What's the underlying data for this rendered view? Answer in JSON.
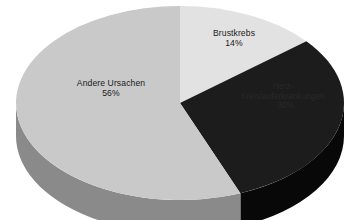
{
  "chart_data": {
    "type": "pie",
    "title": "",
    "subtitle": "",
    "xlabel": "",
    "ylabel": "",
    "legend_position": "none",
    "grid": false,
    "three_d": true,
    "start_angle_deg": 0,
    "direction": "clockwise",
    "categories": [
      "Brustkrebs",
      "Herz-Kreislauferkrankungen",
      "Andere Ursachen"
    ],
    "values": [
      14,
      30,
      56
    ],
    "units": "%",
    "slices": [
      {
        "label": "Brustkrebs",
        "value": 14,
        "value_text": "14%",
        "color": "#e2e2e2",
        "side_color": "#a9a9a9",
        "label_color": "#1a1a1a",
        "start_deg": 0,
        "end_deg": 50.4
      },
      {
        "label": "Herz-Kreislauferkrankungen",
        "value": 30,
        "value_text": "30%",
        "color": "#1c1c1c",
        "side_color": "#080808",
        "label_color": "#2a2a2a",
        "start_deg": 50.4,
        "end_deg": 158.4
      },
      {
        "label": "Andere Ursachen",
        "value": 56,
        "value_text": "56%",
        "color": "#c9c9c9",
        "side_color": "#8a8a8a",
        "label_color": "#1a1a1a",
        "start_deg": 158.4,
        "end_deg": 360
      }
    ],
    "background_color": "#ffffff"
  },
  "labels": {
    "brustkrebs": {
      "name": "Brustkrebs",
      "value": "14%"
    },
    "herz": {
      "name": "Herz-Kreislauferkrankungen",
      "value": "30%"
    },
    "andere": {
      "name": "Andere Ursachen",
      "value": "56%"
    }
  }
}
